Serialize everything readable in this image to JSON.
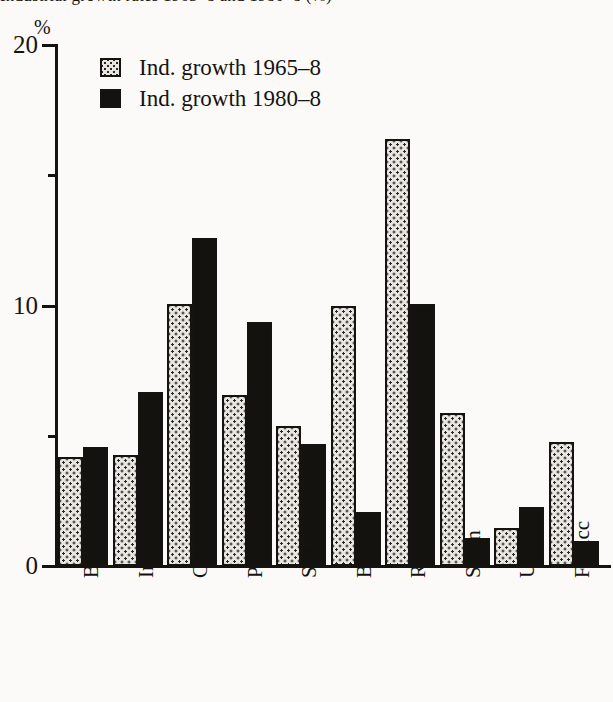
{
  "chart_data": {
    "type": "bar",
    "title": "Industrial growth rates 1965–8 and 1980–8 (%)",
    "title_cropped": true,
    "xlabel": "",
    "ylabel": "%",
    "ylim": [
      0,
      20
    ],
    "y_ticks_major": [
      0,
      10,
      20
    ],
    "y_ticks_minor": [
      5,
      15
    ],
    "y_tick_labels": [
      "0",
      "10",
      "20"
    ],
    "grid": false,
    "legend_position": "top-left",
    "categories": [
      "Bangladesh",
      "India",
      "China",
      "Pakistan",
      "Sri Lanka",
      "Brazil",
      "Rep. Korea",
      "Spain",
      "UK",
      "Francc"
    ],
    "series": [
      {
        "name": "Ind. growth 1965–8",
        "fill": "stipple",
        "color": "#e8e6e0",
        "values": [
          4.1,
          4.2,
          10.0,
          6.5,
          5.3,
          9.9,
          16.3,
          5.8,
          1.4,
          4.7
        ]
      },
      {
        "name": "Ind. growth 1980–8",
        "fill": "solid",
        "color": "#14120f",
        "values": [
          4.5,
          6.6,
          12.5,
          9.3,
          4.6,
          2.0,
          10.0,
          1.0,
          2.2,
          0.9
        ]
      }
    ]
  },
  "axis": {
    "unit_symbol": "%"
  },
  "legend": {
    "items": [
      {
        "label": "Ind. growth 1965–8",
        "style": "light"
      },
      {
        "label": "Ind. growth 1980–8",
        "style": "dark"
      }
    ]
  }
}
